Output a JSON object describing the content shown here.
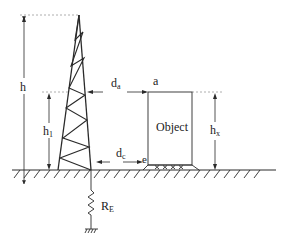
{
  "diagram": {
    "labels": {
      "h": "h",
      "h1_main": "h",
      "h1_sub": "1",
      "da_main": "d",
      "da_sub": "a",
      "dc_main": "d",
      "dc_sub": "c",
      "point_a": "a",
      "point_e": "e",
      "object": "Object",
      "hx_main": "h",
      "hx_sub": "x",
      "re_main": "R",
      "re_sub": "E"
    },
    "colors": {
      "line": "#2a2a2a",
      "dashed": "#9a9a9a",
      "background": "#ffffff"
    }
  }
}
